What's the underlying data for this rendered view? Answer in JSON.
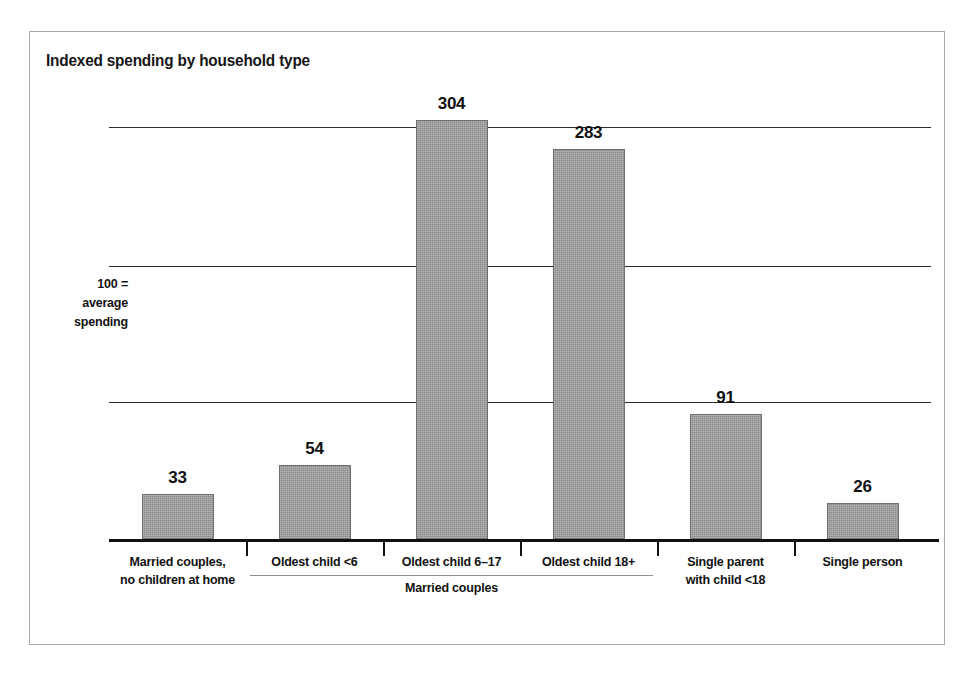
{
  "figure": {
    "title": "Indexed spending by household type",
    "frame_border_color": "#a9a9a9",
    "background_color": "#ffffff"
  },
  "axis": {
    "reference_note_lines": [
      "100 =",
      "average",
      "spending"
    ],
    "gridline_values": [
      300,
      200,
      100
    ],
    "baseline_value": 0,
    "bar_color": "#9a9a9a",
    "bar_border_color": "#6f6f6f"
  },
  "group_bracket": {
    "label": "Married couples",
    "covers_categories": [
      "Oldest child <6",
      "Oldest child 6–17",
      "Oldest child 18+"
    ]
  },
  "chart_data": {
    "type": "bar",
    "title": "Indexed spending by household type",
    "subtitle": "",
    "xlabel": "",
    "ylabel": "100 = average spending",
    "ylim": [
      0,
      304
    ],
    "grid": true,
    "gridlines": [
      100,
      200,
      300
    ],
    "legend": null,
    "categories": [
      "Married couples, no children at home",
      "Oldest child <6",
      "Oldest child 6–17",
      "Oldest child 18+",
      "Single parent with child <18",
      "Single person"
    ],
    "category_label_lines": [
      [
        "Married couples,",
        "no children at home"
      ],
      [
        "Oldest child <6"
      ],
      [
        "Oldest child 6–17"
      ],
      [
        "Oldest child 18+"
      ],
      [
        "Single parent",
        "with child <18"
      ],
      [
        "Single person"
      ]
    ],
    "values": [
      33,
      54,
      304,
      283,
      91,
      26
    ],
    "value_labels": [
      "33",
      "54",
      "304",
      "283",
      "91",
      "26"
    ],
    "annotations": [
      {
        "text": "Married couples",
        "type": "group-bracket",
        "spans": [
          1,
          2,
          3
        ]
      },
      {
        "text": "100 = average spending",
        "type": "y-reference"
      }
    ]
  }
}
